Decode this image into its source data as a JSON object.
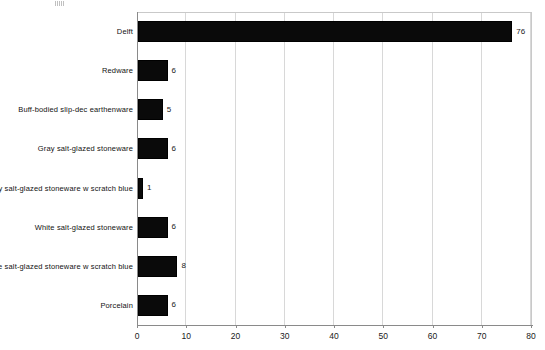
{
  "chart_data": {
    "type": "bar",
    "orientation": "horizontal",
    "title": "",
    "subtitle": "",
    "xlabel": "",
    "ylabel": "",
    "categories": [
      "Delft",
      "Redware",
      "Buff-bodied slip-dec earthenware",
      "Gray salt-glazed stoneware",
      "Gray salt-glazed stoneware w scratch blue",
      "White salt-glazed stoneware",
      "White salt-glazed stoneware w scratch blue",
      "Porcelain"
    ],
    "values": [
      76,
      6,
      5,
      6,
      1,
      6,
      8,
      6
    ],
    "data_labels": [
      "76",
      "6",
      "5",
      "6",
      "1",
      "6",
      "8",
      "6"
    ],
    "xlim": [
      0,
      80
    ],
    "xticks": [
      0,
      10,
      20,
      30,
      40,
      50,
      60,
      70,
      80
    ],
    "xtick_labels": [
      "0",
      "10",
      "20",
      "30",
      "40",
      "50",
      "60",
      "70",
      "80"
    ],
    "grid": {
      "vertical": true,
      "horizontal": false
    },
    "legend": {
      "visible": false,
      "position": "none"
    },
    "colors": {
      "bar_fill": "#0a0a0a",
      "bar_edge": "#000000",
      "gridline": "#d8d8d8",
      "axis_line": "#8a8a8a",
      "background": "#ffffff",
      "label_text": "#121212"
    }
  }
}
